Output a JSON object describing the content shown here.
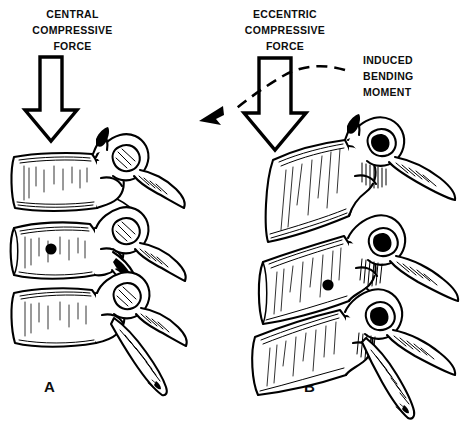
{
  "figure": {
    "type": "anatomical-line-drawing",
    "background_color": "#ffffff",
    "ink_color": "#000000"
  },
  "panel_a": {
    "letter": "A",
    "force_label_line1": "CENTRAL",
    "force_label_line2": "COMPRESSIVE",
    "force_label_line3": "FORCE",
    "arrow": {
      "name": "central-compressive-force-arrow",
      "direction": "down",
      "style": "hollow-block-arrow"
    },
    "vertebrae": [
      {
        "name": "upper-vertebra",
        "alignment": "neutral",
        "body_shape": "rectangular"
      },
      {
        "name": "middle-vertebra",
        "alignment": "neutral",
        "body_shape": "rectangular",
        "marker": "nutrient-foramen-dot"
      },
      {
        "name": "lower-vertebra",
        "alignment": "neutral",
        "body_shape": "rectangular"
      }
    ]
  },
  "panel_b": {
    "letter": "B",
    "force_label_line1": "ECCENTRIC",
    "force_label_line2": "COMPRESSIVE",
    "force_label_line3": "FORCE",
    "moment_label_line1": "INDUCED",
    "moment_label_line2": "BENDING",
    "moment_label_line3": "MOMENT",
    "arrow": {
      "name": "eccentric-compressive-force-arrow",
      "direction": "down",
      "style": "hollow-block-arrow"
    },
    "moment_arrow": {
      "name": "induced-bending-moment-arrow",
      "direction": "curved-right-to-lower-left",
      "style": "dashed-curved-arrow"
    },
    "vertebrae": [
      {
        "name": "upper-vertebra",
        "alignment": "wedged-flexed",
        "body_shape": "anteriorly-compressed"
      },
      {
        "name": "middle-vertebra",
        "alignment": "wedged-flexed",
        "body_shape": "anteriorly-compressed",
        "marker": "nutrient-foramen-dot"
      },
      {
        "name": "lower-vertebra",
        "alignment": "wedged-flexed",
        "body_shape": "anteriorly-compressed"
      }
    ]
  }
}
